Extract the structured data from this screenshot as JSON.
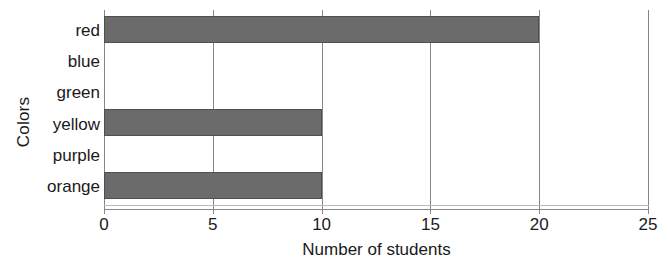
{
  "chart_data": {
    "type": "bar",
    "orientation": "horizontal",
    "title": "",
    "xlabel": "Number of students",
    "ylabel": "Colors",
    "categories": [
      "red",
      "blue",
      "green",
      "yellow",
      "purple",
      "orange"
    ],
    "values": [
      20,
      0,
      0,
      10,
      0,
      10
    ],
    "xlim": [
      0,
      25
    ],
    "xticks": [
      0,
      5,
      10,
      15,
      20,
      25
    ],
    "xtick_labels": [
      "0",
      "5",
      "10",
      "15",
      "20",
      "25"
    ],
    "grid": true,
    "grid_axis": "x",
    "legend": null,
    "bar_color": "#6b6b6b",
    "bar_edge_color": "#4f4f4f",
    "grid_color": "#878787",
    "axis_color": "#8a8a8a",
    "text_color": "#1a1a1a"
  }
}
